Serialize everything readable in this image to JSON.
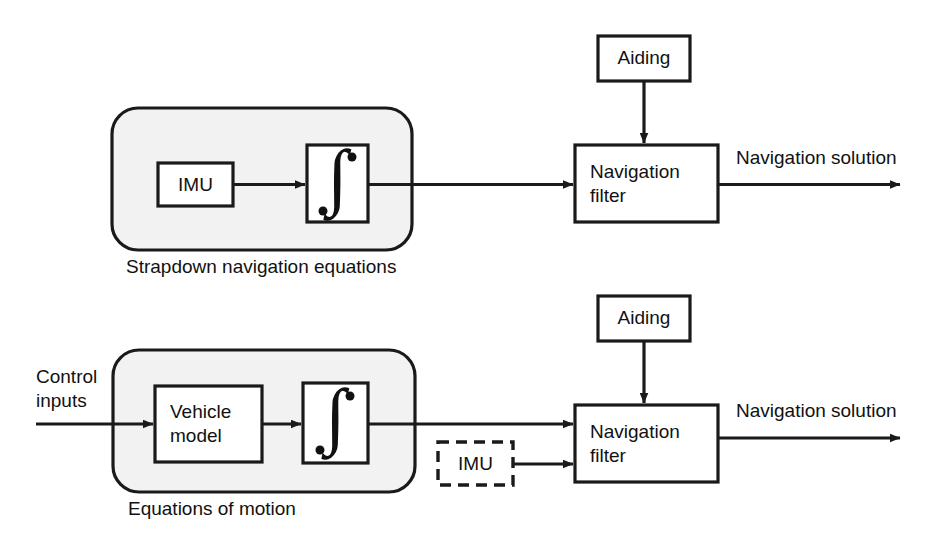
{
  "diagram": {
    "colors": {
      "line": "#1a1a1a",
      "group_fill": "#f2f2f2",
      "box_fill": "#ffffff",
      "page_background": "#ffffff"
    },
    "rows": [
      {
        "id": "top-row",
        "group_caption": "Strapdown navigation equations",
        "blocks": [
          {
            "id": "imu",
            "label": "IMU",
            "style": "solid"
          },
          {
            "id": "integrator",
            "label": "∫",
            "style": "solid"
          },
          {
            "id": "aiding",
            "label": "Aiding",
            "style": "solid"
          },
          {
            "id": "nav-filter",
            "label_line1": "Navigation",
            "label_line2": "filter",
            "style": "solid"
          }
        ],
        "output_label": "Navigation solution"
      },
      {
        "id": "bottom-row",
        "group_caption": "Equations of motion",
        "input_label_line1": "Control",
        "input_label_line2": "inputs",
        "blocks": [
          {
            "id": "vehicle-model",
            "label_line1": "Vehicle",
            "label_line2": "model",
            "style": "solid"
          },
          {
            "id": "integrator",
            "label": "∫",
            "style": "solid"
          },
          {
            "id": "imu-dashed",
            "label": "IMU",
            "style": "dashed"
          },
          {
            "id": "aiding",
            "label": "Aiding",
            "style": "solid"
          },
          {
            "id": "nav-filter",
            "label_line1": "Navigation",
            "label_line2": "filter",
            "style": "solid"
          }
        ],
        "output_label": "Navigation solution"
      }
    ]
  }
}
